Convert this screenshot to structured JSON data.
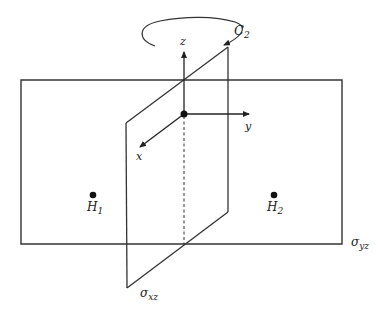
{
  "diagram": {
    "type": "symmetry-elements",
    "rotation_axis": {
      "symbol": "C",
      "subscript": "2"
    },
    "axes": {
      "z": "z",
      "y": "y",
      "x": "x"
    },
    "atoms": [
      {
        "symbol": "H",
        "subscript": "1"
      },
      {
        "symbol": "H",
        "subscript": "2"
      }
    ],
    "planes": [
      {
        "symbol": "σ",
        "subscript": "yz"
      },
      {
        "symbol": "σ",
        "subscript": "xz"
      }
    ],
    "colors": {
      "line": "#333333",
      "background": "#ffffff"
    }
  }
}
